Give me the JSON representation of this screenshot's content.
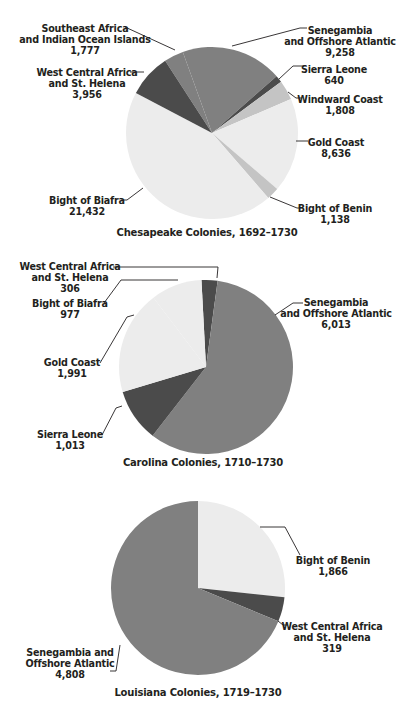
{
  "colors": {
    "dark": "#4b4b4b",
    "medium": "#808080",
    "light": "#c4c4c4",
    "pale": "#ececec",
    "leader": "#231f20"
  },
  "chart_data": [
    {
      "type": "pie",
      "title": "Chesapeake Colonies, 1692–1730",
      "start_angle_deg": 327,
      "slices": [
        {
          "label": "Southeast Africa and Indian Ocean Islands",
          "value": 1777,
          "display": "1,777",
          "shade": "medium"
        },
        {
          "label": "Senegambia and Offshore Atlantic",
          "value": 9258,
          "display": "9,258",
          "shade": "medium"
        },
        {
          "label": "Sierra Leone",
          "value": 640,
          "display": "640",
          "shade": "dark"
        },
        {
          "label": "Windward Coast",
          "value": 1808,
          "display": "1,808",
          "shade": "light"
        },
        {
          "label": "Gold Coast",
          "value": 8636,
          "display": "8,636",
          "shade": "pale"
        },
        {
          "label": "Bight of Benin",
          "value": 1138,
          "display": "1,138",
          "shade": "light"
        },
        {
          "label": "Bight of Biafra",
          "value": 21432,
          "display": "21,432",
          "shade": "pale"
        },
        {
          "label": "West Central Africa and St. Helena",
          "value": 3956,
          "display": "3,956",
          "shade": "dark"
        }
      ]
    },
    {
      "type": "pie",
      "title": "Carolina Colonies, 1710–1730",
      "start_angle_deg": 357,
      "slices": [
        {
          "label": "West Central Africa and St. Helena",
          "value": 306,
          "display": "306",
          "shade": "dark"
        },
        {
          "label": "Senegambia and Offshore Atlantic",
          "value": 6013,
          "display": "6,013",
          "shade": "medium"
        },
        {
          "label": "Sierra Leone",
          "value": 1013,
          "display": "1,013",
          "shade": "dark"
        },
        {
          "label": "Gold Coast",
          "value": 1991,
          "display": "1,991",
          "shade": "pale"
        },
        {
          "label": "Bight of Biafra",
          "value": 977,
          "display": "977",
          "shade": "pale"
        }
      ]
    },
    {
      "type": "pie",
      "title": "Louisiana Colonies, 1719–1730",
      "start_angle_deg": 0,
      "slices": [
        {
          "label": "Bight of Benin",
          "value": 1866,
          "display": "1,866",
          "shade": "pale"
        },
        {
          "label": "West Central Africa and St. Helena",
          "value": 319,
          "display": "319",
          "shade": "dark"
        },
        {
          "label": "Senegambia and Offshore Atlantic",
          "value": 4808,
          "display": "4,808",
          "shade": "medium"
        }
      ]
    }
  ],
  "charts": {
    "chesapeake": {
      "title": "Chesapeake Colonies, 1692–1730",
      "labels": {
        "se_africa": {
          "l1": "Southeast Africa",
          "l2": "and Indian Ocean Islands",
          "v": "1,777"
        },
        "senegambia": {
          "l1": "Senegambia",
          "l2": "and Offshore Atlantic",
          "v": "9,258"
        },
        "sierra_leone": {
          "l1": "Sierra Leone",
          "v": "640"
        },
        "windward": {
          "l1": "Windward Coast",
          "v": "1,808"
        },
        "gold_coast": {
          "l1": "Gold Coast",
          "v": "8,636"
        },
        "benin": {
          "l1": "Bight of Benin",
          "v": "1,138"
        },
        "biafra": {
          "l1": "Bight of Biafra",
          "v": "21,432"
        },
        "wca": {
          "l1": "West Central Africa",
          "l2": "and St. Helena",
          "v": "3,956"
        }
      }
    },
    "carolina": {
      "title": "Carolina Colonies, 1710–1730",
      "labels": {
        "wca": {
          "l1": "West Central Africa",
          "l2": "and St. Helena",
          "v": "306"
        },
        "biafra": {
          "l1": "Bight of Biafra",
          "v": "977"
        },
        "gold_coast": {
          "l1": "Gold Coast",
          "v": "1,991"
        },
        "sierra_leone": {
          "l1": "Sierra Leone",
          "v": "1,013"
        },
        "senegambia": {
          "l1": "Senegambia",
          "l2": "and Offshore Atlantic",
          "v": "6,013"
        }
      }
    },
    "louisiana": {
      "title": "Louisiana Colonies, 1719–1730",
      "labels": {
        "benin": {
          "l1": "Bight of Benin",
          "v": "1,866"
        },
        "wca": {
          "l1": "West Central Africa",
          "l2": "and St. Helena",
          "v": "319"
        },
        "senegambia": {
          "l1": "Senegambia and",
          "l2": "Offshore Atlantic",
          "v": "4,808"
        }
      }
    }
  }
}
